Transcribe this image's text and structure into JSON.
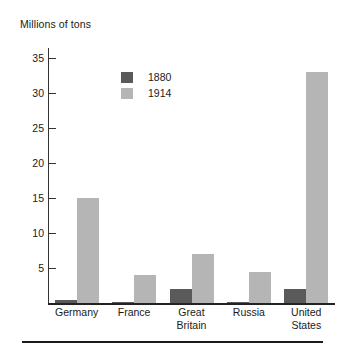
{
  "chart_data": {
    "type": "bar",
    "title": "",
    "ylabel": "Millions of tons",
    "xlabel": "",
    "categories": [
      "Germany",
      "France",
      "Great\nBritain",
      "Russia",
      "United\nStates"
    ],
    "series": [
      {
        "name": "1880",
        "color": "#5a5a5a",
        "values": [
          0.5,
          0.2,
          2,
          0.2,
          2
        ]
      },
      {
        "name": "1914",
        "color": "#b5b5b5",
        "values": [
          15,
          4,
          7,
          4.5,
          33
        ]
      }
    ],
    "ylim": [
      0,
      36.5
    ],
    "yticks": [
      5,
      10,
      15,
      20,
      25,
      30,
      35
    ],
    "ytick_labels": [
      "5",
      "10",
      "15",
      "20",
      "25",
      "30",
      "35"
    ],
    "grid": false,
    "legend_position": "upper-left-inside"
  },
  "legend": {
    "items": [
      {
        "label": "1880",
        "color": "#5a5a5a"
      },
      {
        "label": "1914",
        "color": "#b5b5b5"
      }
    ]
  },
  "axis": {
    "y_title": "Millions of tons"
  }
}
